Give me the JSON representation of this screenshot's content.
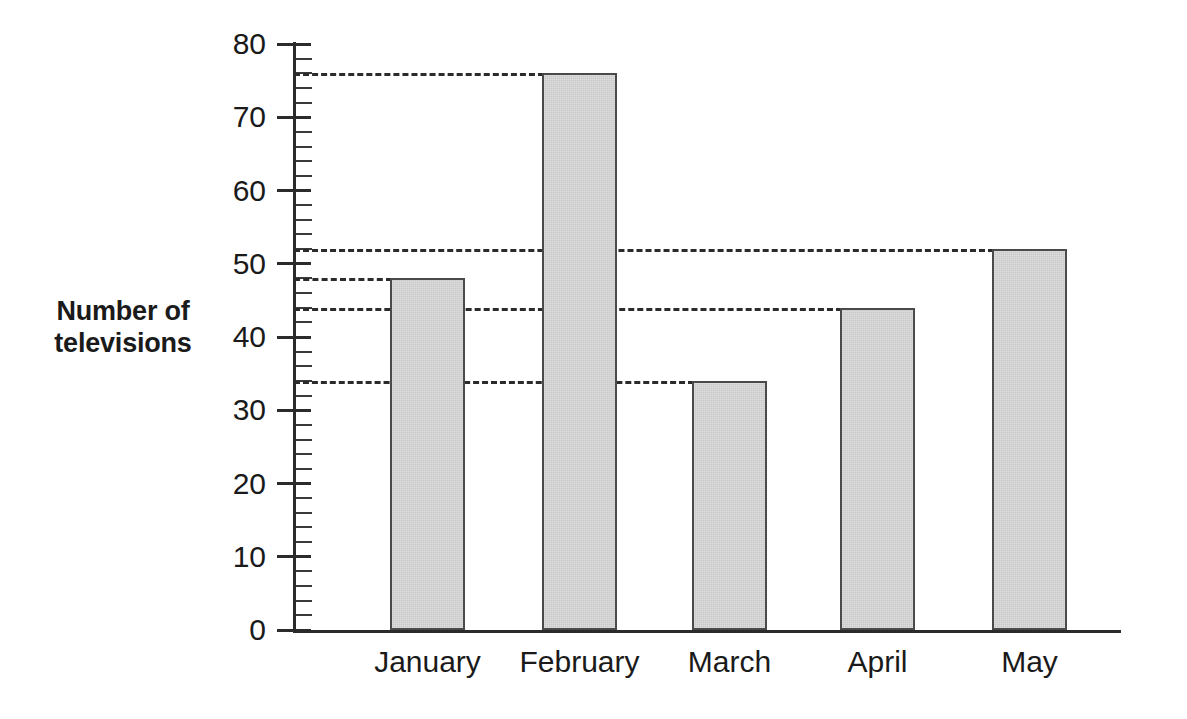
{
  "chart_data": {
    "type": "bar",
    "title": "",
    "xlabel": "",
    "ylabel": "Number of televisions",
    "ylabel_lines": [
      "Number of",
      "televisions"
    ],
    "categories": [
      "January",
      "February",
      "March",
      "April",
      "May"
    ],
    "values": [
      48,
      76,
      34,
      44,
      52
    ],
    "ylim": [
      0,
      80
    ],
    "y_major_ticks": [
      0,
      10,
      20,
      30,
      40,
      50,
      60,
      70,
      80
    ],
    "y_tick_labels": [
      "0",
      "10",
      "20",
      "30",
      "40",
      "50",
      "60",
      "70",
      "80"
    ],
    "y_minor_tick_step": 2,
    "grid": false,
    "legend": null,
    "reference_lines": [
      {
        "value": 76,
        "label": "February level",
        "extends_to_category": "February"
      },
      {
        "value": 52,
        "label": "May level",
        "extends_to_category": "May"
      },
      {
        "value": 48,
        "label": "January level",
        "extends_to_category": "January"
      },
      {
        "value": 44,
        "label": "April level",
        "extends_to_category": "April"
      },
      {
        "value": 34,
        "label": "March level",
        "extends_to_category": "March"
      }
    ],
    "colors": {
      "bar_fill": "#c9c9c9",
      "bar_border": "#4a4a4a",
      "axis": "#2b2b2b",
      "reference_line": "#2b2b2b",
      "background": "#ffffff",
      "text": "#1a1a1a"
    }
  }
}
